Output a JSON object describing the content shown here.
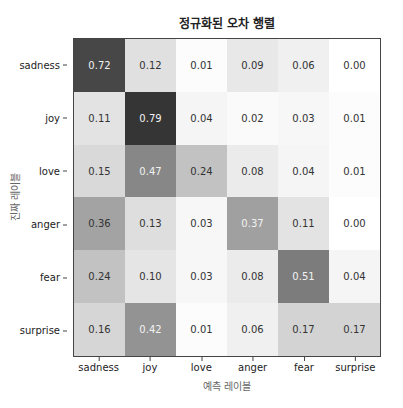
{
  "chart_data": {
    "type": "heatmap",
    "title": "정규화된 오차 행렬",
    "xlabel": "예측 레이블",
    "ylabel": "진짜 레이블",
    "x_categories": [
      "sadness",
      "joy",
      "love",
      "anger",
      "fear",
      "surprise"
    ],
    "y_categories": [
      "sadness",
      "joy",
      "love",
      "anger",
      "fear",
      "surprise"
    ],
    "values": [
      [
        0.72,
        0.12,
        0.01,
        0.09,
        0.06,
        0.0
      ],
      [
        0.11,
        0.79,
        0.04,
        0.02,
        0.03,
        0.01
      ],
      [
        0.15,
        0.47,
        0.24,
        0.08,
        0.04,
        0.01
      ],
      [
        0.36,
        0.13,
        0.03,
        0.37,
        0.11,
        0.0
      ],
      [
        0.24,
        0.1,
        0.03,
        0.08,
        0.51,
        0.04
      ],
      [
        0.16,
        0.42,
        0.01,
        0.06,
        0.17,
        0.17
      ]
    ],
    "value_labels": [
      [
        "0.72",
        "0.12",
        "0.01",
        "0.09",
        "0.06",
        "0.00"
      ],
      [
        "0.11",
        "0.79",
        "0.04",
        "0.02",
        "0.03",
        "0.01"
      ],
      [
        "0.15",
        "0.47",
        "0.24",
        "0.08",
        "0.04",
        "0.01"
      ],
      [
        "0.36",
        "0.13",
        "0.03",
        "0.37",
        "0.11",
        "0.00"
      ],
      [
        "0.24",
        "0.10",
        "0.03",
        "0.08",
        "0.51",
        "0.04"
      ],
      [
        "0.16",
        "0.42",
        "0.01",
        "0.06",
        "0.17",
        "0.17"
      ]
    ],
    "colormap": "Greys",
    "vmin": 0,
    "vmax": 0.8,
    "grid": false,
    "colorbar": false
  }
}
